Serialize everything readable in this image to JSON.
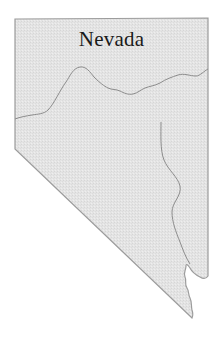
{
  "map": {
    "title": "Nevada",
    "fill_color": "#e3e3e3",
    "border_color": "#9a9a9a",
    "region_line_color": "#8c8c8c"
  }
}
